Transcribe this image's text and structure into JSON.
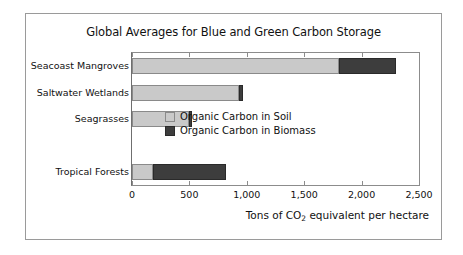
{
  "chart_data": {
    "type": "bar",
    "orientation": "horizontal",
    "stacked": true,
    "title": "Global Averages for Blue and Green Carbon Storage",
    "xlabel": "Tons of CO2 equivalent per hectare",
    "xlabel_parts": {
      "pre": "Tons of CO",
      "sub": "2",
      "post": " equivalent per hectare"
    },
    "ylabel": "",
    "categories": [
      "Seacoast Mangroves",
      "Saltwater Wetlands",
      "Seagrasses",
      "Tropical Forests"
    ],
    "series": [
      {
        "name": "Organic Carbon in Soil",
        "color": "#c9c9c9",
        "values": [
          1800,
          930,
          495,
          180
        ]
      },
      {
        "name": "Organic Carbon in Biomass",
        "color": "#3d3d3d",
        "values": [
          500,
          35,
          25,
          640
        ]
      }
    ],
    "totals": [
      2300,
      965,
      520,
      820
    ],
    "xlim": [
      0,
      2500
    ],
    "xticks": [
      0,
      500,
      1000,
      1500,
      2000,
      2500
    ],
    "xtick_labels": [
      "0",
      "500",
      "1,000",
      "1,500",
      "2,000",
      "2,500"
    ],
    "grid": false,
    "legend_position": "inside-lower-right",
    "legend": [
      {
        "label": "Organic Carbon in Soil",
        "color": "#c9c9c9"
      },
      {
        "label": "Organic Carbon in Biomass",
        "color": "#3d3d3d"
      }
    ],
    "row_slots": [
      0,
      1,
      2,
      4
    ],
    "row_slot_count": 5
  },
  "colors": {
    "soil": "#c9c9c9",
    "biomass": "#3d3d3d",
    "axis": "#8c8c8c",
    "frame": "#9a9a9a",
    "text": "#111111",
    "background": "#ffffff"
  }
}
